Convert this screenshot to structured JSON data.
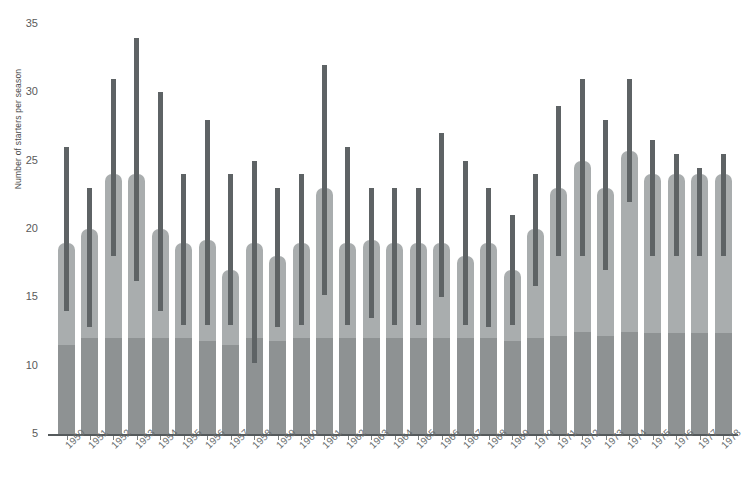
{
  "chart_data": {
    "type": "bar",
    "title": "",
    "xlabel": "",
    "ylabel": "Number of starters per season",
    "ylim": [
      5,
      35
    ],
    "yticks": [
      5,
      10,
      15,
      20,
      25,
      30,
      35
    ],
    "grid": false,
    "legend": null,
    "categories": [
      "1950",
      "1951",
      "1952",
      "1953",
      "1954",
      "1955",
      "1956",
      "1957",
      "1958",
      "1959",
      "1960",
      "1961",
      "1962",
      "1963",
      "1964",
      "1965",
      "1966",
      "1967",
      "1968",
      "1969",
      "1970",
      "1971",
      "1972",
      "1973",
      "1974",
      "1975",
      "1976",
      "1977",
      "1978"
    ],
    "series": [
      {
        "name": "Median number of starters (bar height)",
        "values": [
          19.0,
          20.0,
          24.0,
          24.0,
          20.0,
          19.0,
          19.2,
          17.0,
          19.0,
          18.0,
          19.0,
          23.0,
          19.0,
          19.2,
          19.0,
          19.0,
          19.0,
          18.0,
          19.0,
          17.0,
          20.0,
          23.0,
          25.0,
          23.0,
          25.7,
          24.0,
          24.0,
          24.0,
          24.0
        ]
      },
      {
        "name": "Baseline (darker inner fill top)",
        "values": [
          11.5,
          12.0,
          12.0,
          12.0,
          12.0,
          12.0,
          11.8,
          11.5,
          12.0,
          11.8,
          12.0,
          12.0,
          12.0,
          12.0,
          12.0,
          12.0,
          12.0,
          12.0,
          12.0,
          11.8,
          12.0,
          12.2,
          12.5,
          12.2,
          12.5,
          12.4,
          12.4,
          12.4,
          12.4
        ]
      },
      {
        "name": "Range low (error bar bottom)",
        "values": [
          14.0,
          12.8,
          18.0,
          16.2,
          14.0,
          13.0,
          13.0,
          13.0,
          10.2,
          12.8,
          13.0,
          15.2,
          13.0,
          13.5,
          13.0,
          13.0,
          15.0,
          13.0,
          12.8,
          13.0,
          15.8,
          18.0,
          18.0,
          17.0,
          22.0,
          18.0,
          18.0,
          18.0,
          18.0
        ]
      },
      {
        "name": "Range high (error bar top)",
        "values": [
          26.0,
          23.0,
          31.0,
          34.0,
          30.0,
          24.0,
          28.0,
          24.0,
          25.0,
          23.0,
          24.0,
          32.0,
          26.0,
          23.0,
          23.0,
          23.0,
          27.0,
          25.0,
          23.0,
          21.0,
          24.0,
          29.0,
          31.0,
          28.0,
          31.0,
          26.5,
          25.5,
          24.5,
          25.5
        ]
      }
    ],
    "colors": {
      "bar_outer": "#a9adae",
      "bar_inner": "#8e9293",
      "error_bar": "#5e6365",
      "axis": "#555a5c",
      "tick_text": "#5a5a5a",
      "label_text": "#6a6f70",
      "background": "#ffffff"
    }
  }
}
